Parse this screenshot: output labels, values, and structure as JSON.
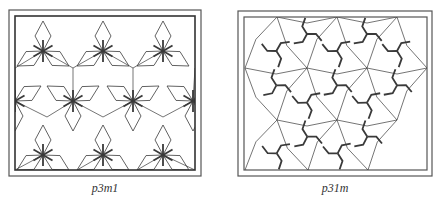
{
  "figures": [
    {
      "id": "p3m1",
      "caption": "p3m1",
      "outer_frame": [
        9,
        10,
        201,
        176
      ],
      "inner_frame": [
        15,
        16,
        195,
        170
      ],
      "centers_star": [
        [
          43,
          51
        ],
        [
          103,
          51
        ],
        [
          163,
          51
        ],
        [
          15,
          101
        ],
        [
          73,
          101
        ],
        [
          133,
          101
        ],
        [
          193,
          101
        ],
        [
          43,
          155
        ],
        [
          103,
          155
        ],
        [
          163,
          155
        ]
      ],
      "hex_vertices": [
        [
          15,
          68
        ],
        [
          73,
          68
        ],
        [
          133,
          68
        ],
        [
          195,
          68
        ],
        [
          47,
          117
        ],
        [
          103,
          117
        ],
        [
          163,
          117
        ],
        [
          15,
          170
        ],
        [
          77,
          170
        ],
        [
          137,
          170
        ],
        [
          195,
          170
        ]
      ]
    },
    {
      "id": "p31m",
      "caption": "p31m",
      "outer_frame": [
        238,
        11,
        432,
        176
      ],
      "inner_frame": [
        244,
        17,
        427,
        170
      ],
      "lattice": [
        [
          277,
          17
        ],
        [
          337,
          17
        ],
        [
          397,
          17
        ],
        [
          245,
          68
        ],
        [
          307,
          68
        ],
        [
          367,
          68
        ],
        [
          427,
          68
        ],
        [
          277,
          120
        ],
        [
          337,
          120
        ],
        [
          397,
          120
        ],
        [
          245,
          170
        ],
        [
          308,
          170
        ],
        [
          368,
          170
        ]
      ]
    }
  ],
  "colors": {
    "line": "#3a3a3a",
    "frame": "#555555"
  }
}
